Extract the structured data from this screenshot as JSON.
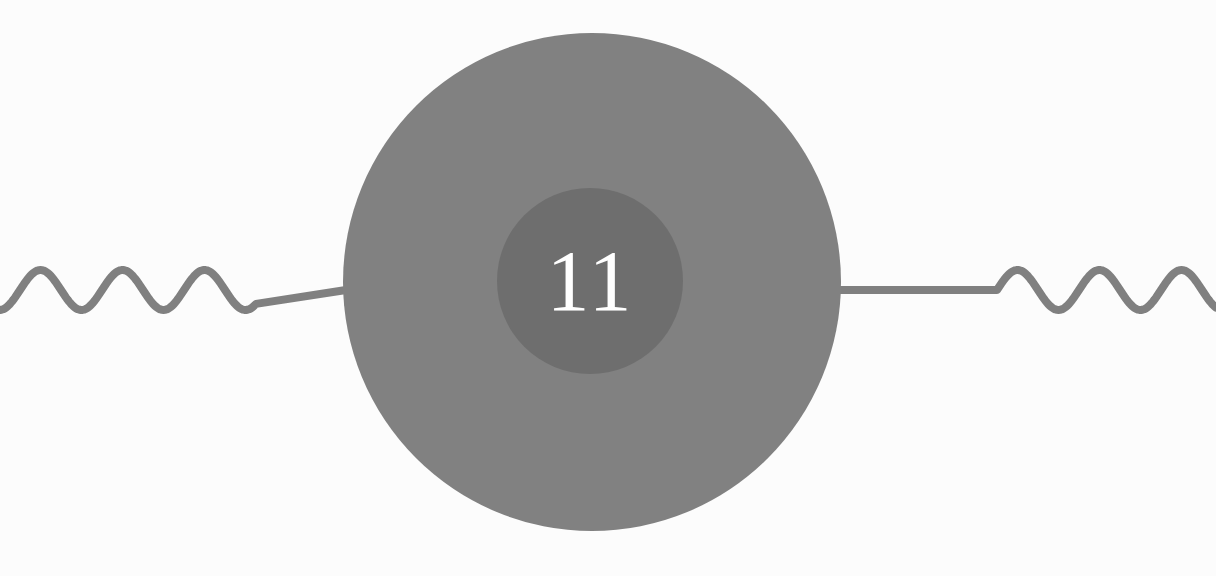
{
  "canvas": {
    "width": 1216,
    "height": 576,
    "background_color": "#fcfcfc"
  },
  "graphic": {
    "title": "Sine wave line interrupted by concentric circles badge",
    "line": {
      "name": "horizontal-wave-line",
      "color": "#808080",
      "stroke_width": 8,
      "baseline_y": 290,
      "amplitude": 20,
      "wavelength": 82,
      "left_wave_start_x": 0,
      "left_wave_end_x": 256,
      "left_flat_end_x": 346,
      "right_flat_start_x": 840,
      "right_wave_start_x": 997,
      "right_wave_end_x": 1216
    },
    "outer_circle": {
      "name": "outer-circle",
      "color": "#818181",
      "center_x": 592,
      "center_y": 282,
      "radius": 249
    },
    "inner_circle": {
      "name": "inner-circle",
      "color": "#6e6e6e",
      "center_x": 590,
      "center_y": 281,
      "radius": 93
    },
    "label": {
      "name": "circle-number-label",
      "value": "11",
      "color": "#ffffff",
      "font_size": 86,
      "center_x": 590,
      "center_y": 281
    }
  }
}
